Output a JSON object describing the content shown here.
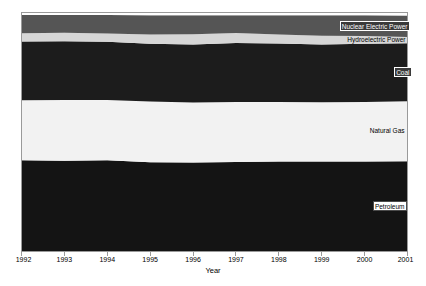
{
  "chart_data": {
    "type": "area",
    "title": "",
    "subtitle": "",
    "xlabel": "Year",
    "ylabel": "",
    "stacked": true,
    "grid": false,
    "legend_position": "right-inline-labels",
    "x": [
      1992,
      1993,
      1994,
      1995,
      1996,
      1997,
      1998,
      1999,
      2000,
      2001
    ],
    "categories": [
      "1992",
      "1993",
      "1994",
      "1995",
      "1996",
      "1997",
      "1998",
      "1999",
      "2000",
      "2001"
    ],
    "xlim": [
      1992,
      2001
    ],
    "ylim": [
      0,
      100
    ],
    "y_axis_visible": false,
    "series": [
      {
        "name": "Petroleum",
        "color": "#141414",
        "label_style": "on-light",
        "values": [
          33.1,
          33.2,
          33.4,
          33.2,
          33.4,
          33.4,
          33.6,
          33.8,
          33.9,
          34.0
        ]
      },
      {
        "name": "Natural Gas",
        "color": "#f2f2f2",
        "label_style": "on-light",
        "values": [
          21.8,
          22.2,
          22.1,
          22.5,
          22.6,
          22.5,
          22.2,
          22.3,
          22.5,
          22.6
        ]
      },
      {
        "name": "Coal",
        "color": "#1c1c1c",
        "label_style": "on-dark",
        "values": [
          21.3,
          21.5,
          21.4,
          21.5,
          21.8,
          22.0,
          21.8,
          21.7,
          21.9,
          21.8
        ]
      },
      {
        "name": "Hydroelectric Power",
        "color": "#d6d6d6",
        "label_style": "plain",
        "values": [
          3.0,
          3.1,
          3.0,
          3.4,
          3.8,
          3.7,
          3.4,
          3.3,
          2.9,
          2.4
        ]
      },
      {
        "name": "Nuclear Electric Power",
        "color": "#555555",
        "label_style": "on-dark",
        "values": [
          6.6,
          6.5,
          6.8,
          7.2,
          7.2,
          6.7,
          7.2,
          7.7,
          7.9,
          8.1
        ]
      },
      {
        "name": "Other",
        "color": "#ffffff",
        "label_style": "plain",
        "values": [
          0.9,
          0.9,
          0.9,
          1.0,
          1.0,
          1.0,
          1.0,
          1.0,
          1.0,
          1.1
        ]
      }
    ],
    "axis": {
      "tick_labels": [
        "1992",
        "1993",
        "1994",
        "1995",
        "1996",
        "1997",
        "1998",
        "1999",
        "2000",
        "2001"
      ]
    }
  },
  "labels": {
    "other": "Other",
    "nuclear": "Nuclear Electric Power",
    "hydro": "Hydroelectric Power",
    "coal": "Coal",
    "natural_gas": "Natural Gas",
    "petroleum": "Petroleum"
  },
  "axis_title": {
    "x": "Year"
  },
  "colors": {
    "petroleum": "#141414",
    "natural_gas": "#f2f2f2",
    "coal": "#1c1c1c",
    "hydro": "#d6d6d6",
    "nuclear": "#555555",
    "other": "#ffffff",
    "frame": "#9a9a9a",
    "text": "#000000"
  }
}
